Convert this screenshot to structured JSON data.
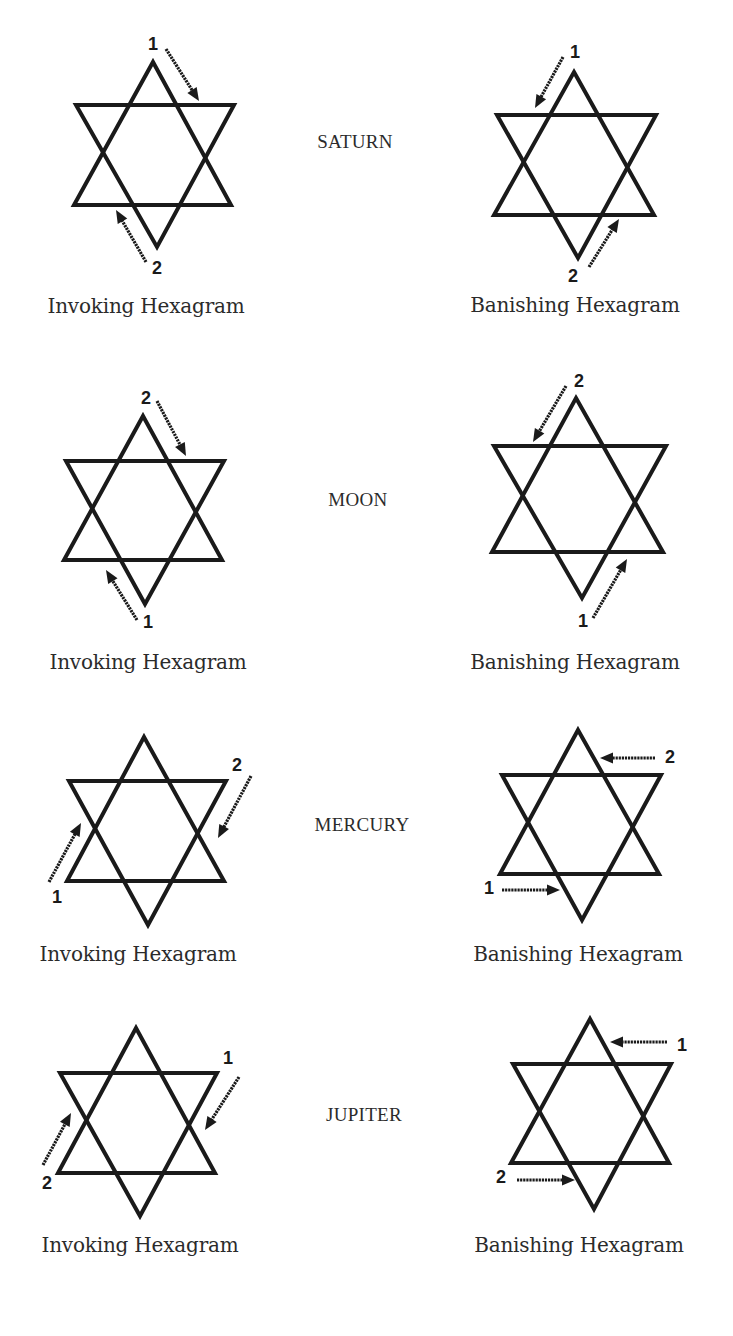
{
  "colors": {
    "background": "#ffffff",
    "ink": "#1a1a1a",
    "text": "#2b2b2b"
  },
  "rows": [
    {
      "planet": "SATURN",
      "planet_pos": [
        355,
        142
      ],
      "invoking": {
        "caption": "Invoking Hexagram",
        "caption_pos": [
          146,
          306
        ],
        "star": {
          "top": [
            153,
            62
          ],
          "upper": [
            76,
            234,
            105
          ],
          "lower": [
            74,
            231,
            205
          ],
          "bottom": [
            157,
            247
          ]
        },
        "steps": [
          {
            "label": "1",
            "num_pos": [
              153,
              44
            ],
            "arrow_from": [
              166,
              49
            ],
            "arrow_to": [
              199,
              101
            ]
          },
          {
            "label": "2",
            "num_pos": [
              157,
              268
            ],
            "arrow_from": [
              146,
              262
            ],
            "arrow_to": [
              116,
              210
            ]
          }
        ]
      },
      "banishing": {
        "caption": "Banishing Hexagram",
        "caption_pos": [
          575,
          305
        ],
        "star": {
          "top": [
            574,
            72
          ],
          "upper": [
            497,
            656,
            115
          ],
          "lower": [
            494,
            654,
            215
          ],
          "bottom": [
            578,
            258
          ]
        },
        "steps": [
          {
            "label": "1",
            "num_pos": [
              575,
              52
            ],
            "arrow_from": [
              563,
              57
            ],
            "arrow_to": [
              535,
              108
            ]
          },
          {
            "label": "2",
            "num_pos": [
              573,
              276
            ],
            "arrow_from": [
              589,
              267
            ],
            "arrow_to": [
              619,
              219
            ]
          }
        ]
      }
    },
    {
      "planet": "MOON",
      "planet_pos": [
        358,
        500
      ],
      "invoking": {
        "caption": "Invoking Hexagram",
        "caption_pos": [
          148,
          662
        ],
        "star": {
          "top": [
            143,
            416
          ],
          "upper": [
            66,
            224,
            461
          ],
          "lower": [
            64,
            222,
            560
          ],
          "bottom": [
            145,
            604
          ]
        },
        "steps": [
          {
            "label": "2",
            "num_pos": [
              146,
              398
            ],
            "arrow_from": [
              157,
              401
            ],
            "arrow_to": [
              186,
              456
            ]
          },
          {
            "label": "1",
            "num_pos": [
              148,
              622
            ],
            "arrow_from": [
              137,
              620
            ],
            "arrow_to": [
              106,
              570
            ]
          }
        ]
      },
      "banishing": {
        "caption": "Banishing Hexagram",
        "caption_pos": [
          575,
          662
        ],
        "star": {
          "top": [
            576,
            398
          ],
          "upper": [
            494,
            666,
            446
          ],
          "lower": [
            492,
            663,
            552
          ],
          "bottom": [
            582,
            598
          ]
        },
        "steps": [
          {
            "label": "2",
            "num_pos": [
              579,
              381
            ],
            "arrow_from": [
              566,
              386
            ],
            "arrow_to": [
              533,
              442
            ]
          },
          {
            "label": "1",
            "num_pos": [
              583,
              621
            ],
            "arrow_from": [
              593,
              618
            ],
            "arrow_to": [
              627,
              559
            ]
          }
        ]
      }
    },
    {
      "planet": "MERCURY",
      "planet_pos": [
        362,
        825
      ],
      "invoking": {
        "caption": "Invoking Hexagram",
        "caption_pos": [
          138,
          954
        ],
        "star": {
          "top": [
            144,
            737
          ],
          "upper": [
            69,
            226,
            781
          ],
          "lower": [
            67,
            224,
            881
          ],
          "bottom": [
            148,
            925
          ]
        },
        "steps": [
          {
            "label": "1",
            "num_pos": [
              57,
              897
            ],
            "arrow_from": [
              49,
              882
            ],
            "arrow_to": [
              81,
              823
            ]
          },
          {
            "label": "2",
            "num_pos": [
              237,
              765
            ],
            "arrow_from": [
              251,
              776
            ],
            "arrow_to": [
              218,
              838
            ]
          }
        ]
      },
      "banishing": {
        "caption": "Banishing Hexagram",
        "caption_pos": [
          578,
          954
        ],
        "star": {
          "top": [
            578,
            730
          ],
          "upper": [
            502,
            661,
            775
          ],
          "lower": [
            500,
            659,
            874
          ],
          "bottom": [
            582,
            920
          ]
        },
        "steps": [
          {
            "label": "2",
            "num_pos": [
              670,
              757
            ],
            "arrow_from": [
              655,
              758
            ],
            "arrow_to": [
              600,
              758
            ]
          },
          {
            "label": "1",
            "num_pos": [
              489,
              888
            ],
            "arrow_from": [
              502,
              890
            ],
            "arrow_to": [
              560,
              890
            ]
          }
        ]
      }
    },
    {
      "planet": "JUPITER",
      "planet_pos": [
        364,
        1115
      ],
      "invoking": {
        "caption": "Invoking Hexagram",
        "caption_pos": [
          140,
          1245
        ],
        "star": {
          "top": [
            136,
            1028
          ],
          "upper": [
            60,
            217,
            1073
          ],
          "lower": [
            58,
            215,
            1173
          ],
          "bottom": [
            140,
            1216
          ]
        },
        "steps": [
          {
            "label": "1",
            "num_pos": [
              228,
              1058
            ],
            "arrow_from": [
              239,
              1077
            ],
            "arrow_to": [
              205,
              1130
            ]
          },
          {
            "label": "2",
            "num_pos": [
              47,
              1183
            ],
            "arrow_from": [
              43,
              1165
            ],
            "arrow_to": [
              71,
              1113
            ]
          }
        ]
      },
      "banishing": {
        "caption": "Banishing Hexagram",
        "caption_pos": [
          579,
          1245
        ],
        "star": {
          "top": [
            590,
            1019
          ],
          "upper": [
            513,
            671,
            1064
          ],
          "lower": [
            511,
            669,
            1163
          ],
          "bottom": [
            594,
            1209
          ]
        },
        "steps": [
          {
            "label": "1",
            "num_pos": [
              682,
              1045
            ],
            "arrow_from": [
              667,
              1042
            ],
            "arrow_to": [
              610,
              1042
            ]
          },
          {
            "label": "2",
            "num_pos": [
              501,
              1177
            ],
            "arrow_from": [
              517,
              1180
            ],
            "arrow_to": [
              575,
              1180
            ]
          }
        ]
      }
    }
  ]
}
